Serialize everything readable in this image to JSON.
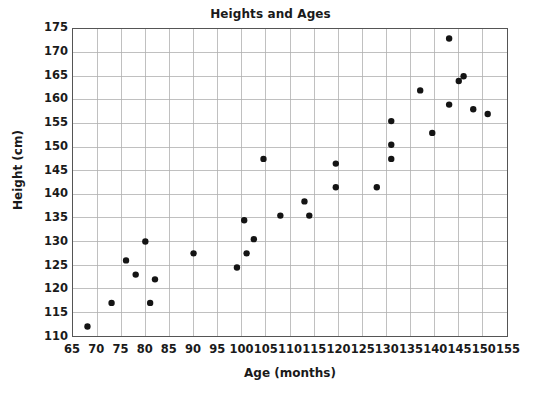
{
  "chart_data": {
    "type": "scatter",
    "title": "Heights and Ages",
    "xlabel": "Age (months)",
    "ylabel": "Height (cm)",
    "xlim": [
      65,
      155
    ],
    "ylim": [
      110,
      175
    ],
    "xticks": [
      65,
      70,
      75,
      80,
      85,
      90,
      95,
      100,
      105,
      110,
      115,
      120,
      125,
      130,
      135,
      140,
      145,
      150,
      155
    ],
    "yticks": [
      110,
      115,
      120,
      125,
      130,
      135,
      140,
      145,
      150,
      155,
      160,
      165,
      170,
      175
    ],
    "grid": true,
    "legend": false,
    "marker_color": "#141414",
    "grid_color": "#b0b0b0",
    "axis_color": "#555555",
    "points": [
      {
        "x": 68,
        "y": 112
      },
      {
        "x": 73,
        "y": 117
      },
      {
        "x": 76,
        "y": 126
      },
      {
        "x": 78,
        "y": 123
      },
      {
        "x": 81,
        "y": 117
      },
      {
        "x": 80,
        "y": 130
      },
      {
        "x": 82,
        "y": 122
      },
      {
        "x": 90,
        "y": 127.5
      },
      {
        "x": 99,
        "y": 124.5
      },
      {
        "x": 100.5,
        "y": 134.5
      },
      {
        "x": 101,
        "y": 127.5
      },
      {
        "x": 102.5,
        "y": 130.5
      },
      {
        "x": 104.5,
        "y": 147.5
      },
      {
        "x": 108,
        "y": 135.5
      },
      {
        "x": 113,
        "y": 138.5
      },
      {
        "x": 114,
        "y": 135.5
      },
      {
        "x": 119.5,
        "y": 146.5
      },
      {
        "x": 119.5,
        "y": 141.5
      },
      {
        "x": 128,
        "y": 141.5
      },
      {
        "x": 131,
        "y": 155.5
      },
      {
        "x": 131,
        "y": 150.5
      },
      {
        "x": 131,
        "y": 147.5
      },
      {
        "x": 137,
        "y": 162
      },
      {
        "x": 139.5,
        "y": 153
      },
      {
        "x": 143,
        "y": 173
      },
      {
        "x": 143,
        "y": 159
      },
      {
        "x": 145,
        "y": 164
      },
      {
        "x": 146,
        "y": 165
      },
      {
        "x": 148,
        "y": 158
      },
      {
        "x": 151,
        "y": 157
      }
    ]
  }
}
